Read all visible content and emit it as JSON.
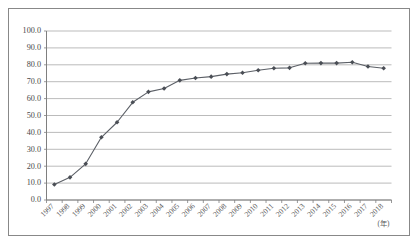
{
  "chart_data": {
    "type": "line",
    "title": "",
    "xlabel": "(年)",
    "ylabel": "",
    "xlim": [
      1997,
      2018
    ],
    "ylim": [
      0,
      100
    ],
    "grid": "horizontal",
    "legend": "none",
    "marker": "diamond",
    "line_color": "#5b5f66",
    "marker_color": "#4a4e55",
    "gridline_color": "#a9a9a9",
    "axis_color": "#7f7f7f",
    "background_color": "#ffffff",
    "categories": [
      "1997",
      "1998",
      "1999",
      "2000",
      "2001",
      "2002",
      "2003",
      "2004",
      "2005",
      "2006",
      "2007",
      "2008",
      "2009",
      "2010",
      "2011",
      "2012",
      "2013",
      "2014",
      "2015",
      "2016",
      "2017",
      "2018"
    ],
    "values": [
      9.2,
      13.4,
      21.4,
      37.1,
      46.0,
      57.8,
      64.0,
      66.0,
      70.8,
      72.2,
      73.0,
      74.5,
      75.3,
      76.8,
      78.0,
      78.2,
      80.9,
      81.0,
      81.0,
      81.5,
      79.0,
      78.0
    ],
    "y_ticks": [
      "0.0",
      "10.0",
      "20.0",
      "30.0",
      "40.0",
      "50.0",
      "60.0",
      "70.0",
      "80.0",
      "90.0",
      "100.0"
    ],
    "y_tick_values": [
      0,
      10,
      20,
      30,
      40,
      50,
      60,
      70,
      80,
      90,
      100
    ]
  }
}
